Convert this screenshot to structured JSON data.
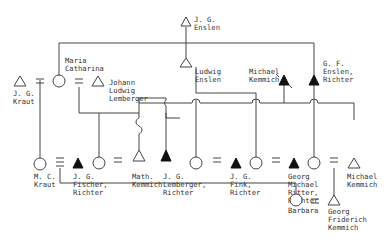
{
  "diagram": {
    "type": "kinship-genealogy",
    "legend_symbols": {
      "triangle": "male",
      "circle": "female",
      "filled-triangle": "male (Richter)",
      "equals": "marriage"
    },
    "persons": [
      {
        "id": "jg_enslen",
        "sex": "male",
        "filled": false,
        "label": [
          "J. G.",
          "Enslen"
        ]
      },
      {
        "id": "jg_kraut",
        "sex": "male",
        "filled": false,
        "label": [
          "J. G.",
          "Kraut"
        ]
      },
      {
        "id": "maria_catharina",
        "sex": "female",
        "filled": false,
        "label": [
          "Maria",
          "Catharina"
        ]
      },
      {
        "id": "johann_ludwig_lemberger",
        "sex": "male",
        "filled": false,
        "label": [
          "Johann",
          "Ludwig",
          "Lemberger"
        ]
      },
      {
        "id": "ludwig_enslen",
        "sex": "male",
        "filled": false,
        "label": [
          "Ludwig",
          "Enslen"
        ]
      },
      {
        "id": "michael_kemmich_top",
        "sex": "male",
        "filled": true,
        "label": [
          "Michael",
          "Kemmich"
        ]
      },
      {
        "id": "gf_enslen",
        "sex": "male",
        "filled": true,
        "label": [
          "G. F.",
          "Enslen,",
          "Richter"
        ]
      },
      {
        "id": "mc_kraut",
        "sex": "female",
        "filled": false,
        "label": [
          "M. C.",
          "Kraut"
        ]
      },
      {
        "id": "jg_fischer",
        "sex": "male",
        "filled": true,
        "label": [
          "J. G.",
          "Fischer,",
          "Richter"
        ]
      },
      {
        "id": "daughter1",
        "sex": "female",
        "filled": false,
        "label": []
      },
      {
        "id": "math_kemmich",
        "sex": "male",
        "filled": false,
        "label": [
          "Math.",
          "Kemmich"
        ]
      },
      {
        "id": "jg_lemberger",
        "sex": "male",
        "filled": true,
        "label": [
          "J. G.",
          "Lemberger,",
          "Richter"
        ]
      },
      {
        "id": "daughter2",
        "sex": "female",
        "filled": false,
        "label": []
      },
      {
        "id": "jg_fink",
        "sex": "male",
        "filled": true,
        "label": [
          "J. G.",
          "Fink,",
          "Richter"
        ]
      },
      {
        "id": "daughter3",
        "sex": "female",
        "filled": false,
        "label": []
      },
      {
        "id": "georg_michael_ritter",
        "sex": "male",
        "filled": true,
        "label": [
          "Georg",
          "Michael",
          "Ritter,",
          "Richter"
        ]
      },
      {
        "id": "daughter4",
        "sex": "female",
        "filled": false,
        "label": []
      },
      {
        "id": "michael_kemmich_bottom",
        "sex": "male",
        "filled": false,
        "label": [
          "Michael",
          "Kemmich"
        ]
      },
      {
        "id": "barbara",
        "sex": "female",
        "filled": false,
        "label": [
          "Barbara"
        ]
      },
      {
        "id": "georg_friderich_kemmich",
        "sex": "male",
        "filled": false,
        "label": [
          "Georg",
          "Friderich",
          "Kemmich"
        ]
      }
    ]
  }
}
